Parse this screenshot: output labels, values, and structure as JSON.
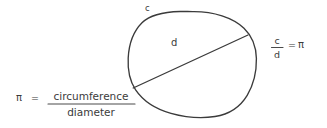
{
  "figure": {
    "kind": "hand-drawn-geometry-sketch",
    "background_color": "#ffffff",
    "ink_color": "#3b3b3b",
    "width": 327,
    "height": 128
  },
  "circle": {
    "name": "circle-outline",
    "description": "hand-drawn circle",
    "bounds": {
      "left": 128,
      "top": 11,
      "right": 256,
      "bottom": 117
    }
  },
  "diameter": {
    "name": "diameter-line",
    "description": "chord through center",
    "from": {
      "x": 133,
      "y": 88
    },
    "to": {
      "x": 248,
      "y": 35
    }
  },
  "labels": {
    "circumference_label": "c",
    "diameter_label": "d"
  },
  "formula_right": {
    "numerator": "c",
    "denominator": "d",
    "equals": "=",
    "result": "π"
  },
  "formula_bottom": {
    "symbol": "π",
    "equals": "=",
    "numerator": "circumference",
    "denominator": "diameter"
  }
}
